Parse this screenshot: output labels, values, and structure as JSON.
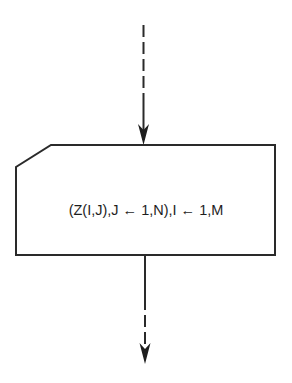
{
  "diagram": {
    "type": "flowchart-fragment",
    "shape": "card-io-block",
    "statement": "(Z(I,J),J ← 1,N),I ← 1,M",
    "incoming_arrow": {
      "style": "dashed-then-solid",
      "direction": "down"
    },
    "outgoing_arrow": {
      "style": "solid-then-dashed",
      "direction": "down"
    }
  }
}
